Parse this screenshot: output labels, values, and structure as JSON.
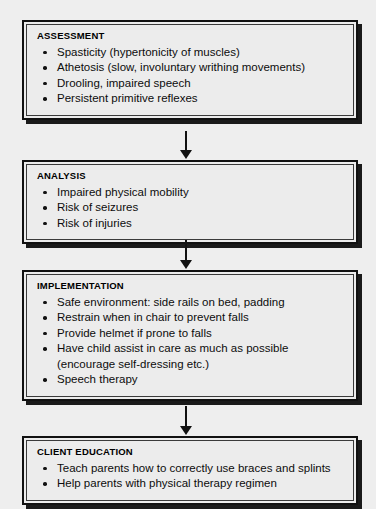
{
  "diagram": {
    "background_color": "#eeeeee",
    "box_fill_color": "#ececec",
    "border_color": "#111111",
    "shadow_color": "#1a1a1a",
    "connector_label": "downward arrow"
  },
  "stages": [
    {
      "title": "ASSESSMENT",
      "items": [
        "Spasticity (hypertonicity of muscles)",
        "Athetosis (slow, involuntary writhing movements)",
        "Drooling, impaired speech",
        "Persistent primitive reflexes"
      ]
    },
    {
      "title": "ANALYSIS",
      "items": [
        "Impaired physical mobility",
        "Risk of seizures",
        "Risk of injuries"
      ]
    },
    {
      "title": "IMPLEMENTATION",
      "items": [
        "Safe environment: side rails on bed, padding",
        "Restrain when in chair to prevent falls",
        "Provide helmet if prone to falls",
        "Have child assist in care as much as possible",
        "Speech therapy"
      ],
      "continuation": {
        "after_item_index": 3,
        "text": "(encourage self-dressing etc.)"
      }
    },
    {
      "title": "CLIENT EDUCATION",
      "items": [
        "Teach parents how to correctly use braces and splints",
        "Help parents with physical therapy regimen"
      ]
    }
  ]
}
